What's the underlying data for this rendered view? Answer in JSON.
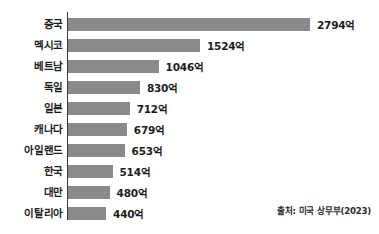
{
  "chart_data": {
    "type": "bar",
    "orientation": "horizontal",
    "title": "",
    "xlabel": "",
    "ylabel": "",
    "unit_suffix": "억",
    "categories": [
      "중국",
      "멕시코",
      "베트남",
      "독일",
      "일본",
      "캐나다",
      "아일랜드",
      "한국",
      "대만",
      "이탈리아"
    ],
    "values": [
      2794,
      1524,
      1046,
      830,
      712,
      679,
      653,
      514,
      480,
      440
    ],
    "value_labels": [
      "2794억",
      "1524억",
      "1046억",
      "830억",
      "712억",
      "679억",
      "653억",
      "514억",
      "480억",
      "440억"
    ],
    "xlim": [
      0,
      2794
    ],
    "grid": false,
    "legend": null,
    "bar_color": "#8a8a8a",
    "text_color": "#1d1d1d",
    "axis_color": "#3a3a3a",
    "background": "#ffffff",
    "annotations": [
      "출처: 미국 상무부(2023)"
    ]
  },
  "source": {
    "note": "출처: 미국 상무부(2023)"
  }
}
